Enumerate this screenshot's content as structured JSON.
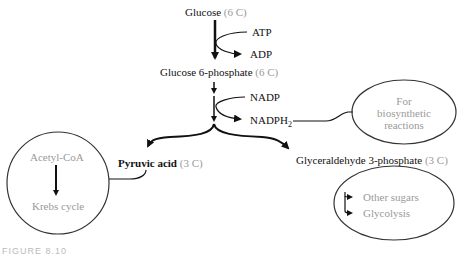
{
  "diagram": {
    "nodes": {
      "glucose": {
        "name": "Glucose",
        "carbons": "6 C"
      },
      "atp": {
        "label": "ATP"
      },
      "adp": {
        "label": "ADP"
      },
      "g6p": {
        "name": "Glucose 6-phosphate",
        "carbons": "6 C"
      },
      "nadp": {
        "label": "NADP"
      },
      "nadph2": {
        "label": "NADPH",
        "subscript": "2"
      },
      "biosynthetic": {
        "line1": "For",
        "line2": "biosynthetic",
        "line3": "reactions"
      },
      "pyruvic": {
        "name": "Pyruvic acid",
        "carbons": "3 C"
      },
      "g3p": {
        "name": "Glyceraldehyde 3-phosphate",
        "carbons": "3 C"
      },
      "acetyl_coa": {
        "label": "Acetyl-CoA"
      },
      "krebs": {
        "label": "Krebs cycle"
      },
      "other_sugars": {
        "label": "Other sugars"
      },
      "glycolysis": {
        "label": "Glycolysis"
      }
    },
    "caption": "FIGURE 8.10",
    "colors": {
      "text": "#111111",
      "muted": "#9a9a9a",
      "line": "#111111"
    }
  }
}
